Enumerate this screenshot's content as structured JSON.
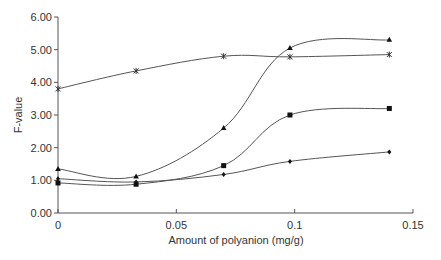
{
  "chart_data": {
    "type": "line",
    "title": "",
    "xlabel": "Amount of polyanion (mg/g)",
    "ylabel": "F-value",
    "xlim": [
      0,
      0.15
    ],
    "ylim": [
      0,
      6
    ],
    "x_ticks": [
      "0",
      "0.05",
      "0.1",
      "0.15"
    ],
    "y_ticks": [
      "0.00",
      "1.00",
      "2.00",
      "3.00",
      "4.00",
      "5.00",
      "6.00"
    ],
    "grid": false,
    "legend": null,
    "smoothed": true,
    "x": [
      0,
      0.033,
      0.07,
      0.098,
      0.14
    ],
    "series": [
      {
        "name": "triangle-series",
        "marker": "triangle",
        "values": [
          1.35,
          1.12,
          2.6,
          5.05,
          5.3
        ]
      },
      {
        "name": "star-series",
        "marker": "star",
        "values": [
          3.8,
          4.35,
          4.8,
          4.78,
          4.85
        ]
      },
      {
        "name": "square-series",
        "marker": "square",
        "values": [
          0.92,
          0.88,
          1.45,
          3.0,
          3.2
        ]
      },
      {
        "name": "diamond-series",
        "marker": "diamond",
        "values": [
          1.05,
          0.95,
          1.18,
          1.58,
          1.87
        ]
      }
    ]
  },
  "colors": {
    "line": "#555555",
    "marker": "#111111",
    "text": "#333333"
  }
}
